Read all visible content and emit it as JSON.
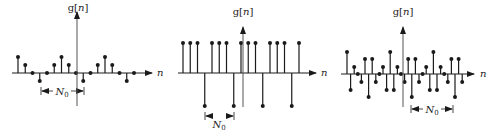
{
  "figure": {
    "background": "#ffffff",
    "ink_color": "#1a1a1a",
    "axis_color": "#555555"
  },
  "plots": [
    {
      "id": "plot-1",
      "y_label": "g[n]",
      "x_label": "n",
      "period_label": "N0",
      "period_label_main": "N",
      "period_label_sub": "0",
      "axis_y": 73,
      "vaxis_x": 77,
      "x_start": 18,
      "spacing": 7.25,
      "x_axis_from": 12,
      "x_axis_to": 152,
      "n_label_x": 157,
      "vaxis_top": 12,
      "vaxis_bottom": 106,
      "y_label_x": 78,
      "y_label_y": 11,
      "bracket": {
        "x1": 41,
        "x2": 84,
        "y": 91,
        "label_x": 62,
        "label_y": 95
      },
      "values": [
        16,
        8,
        0,
        -8,
        0,
        8,
        16,
        8,
        0,
        -8,
        0,
        8,
        16,
        8,
        0,
        -8,
        0
      ]
    },
    {
      "id": "plot-2",
      "y_label": "g[n]",
      "x_label": "n",
      "period_label": "N0",
      "period_label_main": "N",
      "period_label_sub": "0",
      "axis_y": 73,
      "vaxis_x": 243,
      "x_start": 183,
      "spacing": 7.25,
      "x_axis_from": 178,
      "x_axis_to": 316,
      "n_label_x": 321,
      "vaxis_top": 27,
      "vaxis_bottom": 107,
      "y_label_x": 243,
      "y_label_y": 15,
      "bracket": {
        "x1": 205,
        "x2": 234,
        "y": 116,
        "label_x": 219,
        "label_y": 128
      },
      "values": [
        30,
        30,
        30,
        -33,
        30,
        30,
        30,
        -33,
        30,
        30,
        30,
        -33,
        30,
        30,
        30,
        -33,
        30
      ]
    },
    {
      "id": "plot-3",
      "y_label": "g[n]",
      "x_label": "n",
      "period_label": "N0",
      "period_label_main": "N",
      "period_label_sub": "0",
      "axis_y": 74,
      "vaxis_x": 403,
      "x_start": 347,
      "spacing": 3.6,
      "x_axis_from": 341,
      "x_axis_to": 474,
      "n_label_x": 480,
      "vaxis_top": 27,
      "vaxis_bottom": 107,
      "y_label_x": 403,
      "y_label_y": 15,
      "bracket": {
        "x1": 411,
        "x2": 453,
        "y": 109,
        "label_x": 432,
        "label_y": 113
      },
      "values": [
        22,
        -16,
        7,
        0,
        -8,
        15,
        -23,
        15,
        -8,
        0,
        7,
        -16,
        22,
        -16,
        7,
        0,
        -8,
        15,
        -23,
        15,
        -8,
        0,
        7,
        -16,
        22,
        -16,
        7,
        0,
        -8,
        15,
        -23,
        15,
        -8
      ]
    }
  ]
}
